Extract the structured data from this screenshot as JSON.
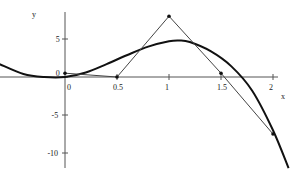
{
  "chart_data": {
    "type": "line",
    "title": "",
    "xlabel": "x",
    "ylabel": "y",
    "xlim": [
      -0.63,
      2.2
    ],
    "ylim": [
      -12,
      8.5
    ],
    "x_ticks": [
      0,
      0.5,
      1,
      1.5,
      2
    ],
    "x_tick_labels": [
      "0",
      "0.5",
      "1",
      "1.5",
      "2"
    ],
    "y_ticks": [
      5,
      0,
      -5,
      -10
    ],
    "y_tick_labels": [
      "5",
      "0",
      "-5",
      "-10"
    ],
    "grid": false,
    "legend": null,
    "series": [
      {
        "name": "curve",
        "style": "thick",
        "x": [
          -0.63,
          -0.4,
          -0.2,
          0,
          0.2,
          0.4,
          0.6,
          0.8,
          1.0,
          1.1,
          1.2,
          1.4,
          1.6,
          1.8,
          2.0,
          2.15
        ],
        "y": [
          1.7,
          0.4,
          0.0,
          0.0,
          0.6,
          1.7,
          2.9,
          4.0,
          4.7,
          4.8,
          4.6,
          3.4,
          1.4,
          -1.8,
          -7.0,
          -12.0
        ]
      },
      {
        "name": "control-polygon",
        "style": "thin",
        "markers": true,
        "x": [
          0,
          0.5,
          1,
          1.5,
          2
        ],
        "y": [
          0.5,
          0,
          8,
          0.5,
          -7.5
        ]
      }
    ]
  },
  "axes": {
    "x_label": "x",
    "y_label": "y"
  }
}
